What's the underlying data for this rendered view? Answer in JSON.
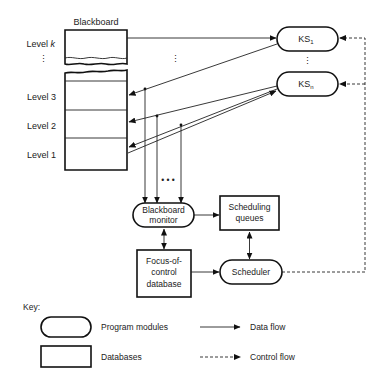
{
  "diagram": {
    "blackboard": {
      "title": "Blackboard",
      "levels": [
        "Level k",
        "Level 3",
        "Level 2",
        "Level 1"
      ],
      "level_k_prefix": "Level ",
      "level_k_var": "k",
      "ellipsis": "⋮"
    },
    "knowledge_sources": [
      {
        "base": "KS",
        "sub": "1"
      },
      {
        "base": "KS",
        "sub": "n"
      }
    ],
    "components": {
      "blackboard_monitor": [
        "Blackboard",
        "monitor"
      ],
      "scheduling_queues": [
        "Scheduling",
        "queues"
      ],
      "focus_of_control": [
        "Focus-of-",
        "control",
        "database"
      ],
      "scheduler": "Scheduler"
    },
    "ellipsis_dots": "• • •",
    "key": {
      "title": "Key:",
      "items": [
        {
          "shape": "rounded",
          "label": "Program modules"
        },
        {
          "shape": "rect",
          "label": "Databases"
        },
        {
          "line": "solid",
          "label": "Data flow"
        },
        {
          "line": "dashed",
          "label": "Control flow"
        }
      ]
    },
    "colors": {
      "stroke": "#111111",
      "background": "#ffffff"
    }
  }
}
